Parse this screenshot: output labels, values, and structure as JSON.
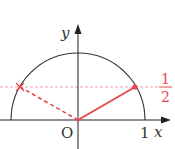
{
  "diagram": {
    "type": "unit-circle-upper-half",
    "axes": {
      "x_label": "x",
      "y_label": "y",
      "origin_label": "O",
      "x_tick_label": "1"
    },
    "horizontal_line": {
      "value_numerator": "1",
      "value_denominator": "2",
      "style": "dashed"
    },
    "points": [
      {
        "name": "intersection-right",
        "marker": "dot"
      },
      {
        "name": "intersection-left",
        "marker": "cross"
      }
    ],
    "colors": {
      "axis": "#222222",
      "accent": "#e8474d",
      "accent_light": "#f2a0a4"
    }
  }
}
